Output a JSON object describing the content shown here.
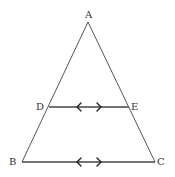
{
  "diagram": {
    "type": "geometry-triangle",
    "colors": {
      "background": "#ffffff",
      "lines": "#555555",
      "labels": "#333333"
    },
    "points": {
      "A": {
        "label": "A",
        "x": 88,
        "y": 22,
        "label_x": 85,
        "label_y": 18
      },
      "B": {
        "label": "B",
        "x": 22,
        "y": 162,
        "label_x": 9,
        "label_y": 165
      },
      "C": {
        "label": "C",
        "x": 155,
        "y": 162,
        "label_x": 157,
        "label_y": 165
      },
      "D": {
        "label": "D",
        "x": 49,
        "y": 107,
        "label_x": 36,
        "label_y": 110
      },
      "E": {
        "label": "E",
        "x": 129,
        "y": 107,
        "label_x": 131,
        "label_y": 110
      }
    },
    "segments": [
      {
        "from": "A",
        "to": "B"
      },
      {
        "from": "A",
        "to": "C"
      },
      {
        "from": "B",
        "to": "C",
        "parallel_mark": true
      },
      {
        "from": "D",
        "to": "E",
        "parallel_mark": true
      }
    ],
    "relations": [
      "DE ∥ BC"
    ]
  }
}
